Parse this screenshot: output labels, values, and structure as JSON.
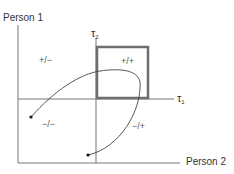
{
  "diagram": {
    "axes": {
      "person1_label": "Person 1",
      "person2_label": "Person 2",
      "tau1_symbol": "τ",
      "tau1_sub": "1",
      "tau2_symbol": "τ",
      "tau2_sub": "2"
    },
    "quadrants": {
      "top_left": "+/−",
      "top_right": "+/+",
      "bottom_left": "−/−",
      "bottom_right": "−/+"
    },
    "colors": {
      "axis": "#666666",
      "box": "#6e6e6e",
      "curve": "#444444",
      "dot": "#111111"
    }
  }
}
